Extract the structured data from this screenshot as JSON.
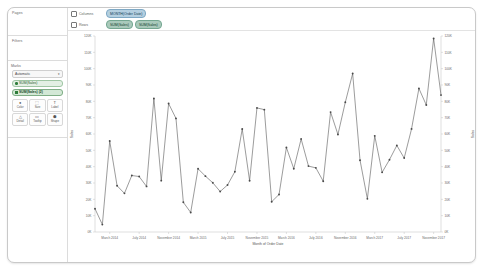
{
  "app": {
    "sidebar": {
      "pages_label": "Pages",
      "filters_label": "Filters",
      "marks_label": "Marks",
      "mark_type": "Automatic",
      "mark_type_caret": "▾",
      "shelf_pills": [
        {
          "text": "SUM(Sales)",
          "icon": "measure-dot"
        },
        {
          "text": "SUM(Sales) (2)",
          "icon": "measure-square"
        }
      ],
      "mark_buttons": [
        {
          "label": "Color",
          "icon": "color-icon",
          "glyph": "●"
        },
        {
          "label": "Size",
          "icon": "size-icon",
          "glyph": "⬚"
        },
        {
          "label": "Label",
          "icon": "label-icon",
          "glyph": "T"
        },
        {
          "label": "Detail",
          "icon": "detail-icon",
          "glyph": "△"
        },
        {
          "label": "Tooltip",
          "icon": "tooltip-icon",
          "glyph": "▭"
        },
        {
          "label": "Shape",
          "icon": "shape-icon",
          "glyph": "⬢"
        }
      ]
    },
    "shelves": {
      "columns_label": "Columns",
      "rows_label": "Rows",
      "columns_pills": [
        {
          "text": "MONTH(Order Date)",
          "color": "blue"
        }
      ],
      "rows_pills": [
        {
          "text": "SUM(Sales)",
          "color": "teal"
        },
        {
          "text": "SUM(Sales)",
          "color": "teal"
        }
      ]
    }
  },
  "chart_data": {
    "type": "line",
    "title": "",
    "xlabel": "Month of Order Date",
    "ylabel": "Sales",
    "ylabel_right": "Sales",
    "ylim": [
      0,
      120000
    ],
    "ytick_values": [
      0,
      10000,
      20000,
      30000,
      40000,
      50000,
      60000,
      70000,
      80000,
      90000,
      100000,
      110000,
      120000
    ],
    "ytick_labels": [
      "0K",
      "10K",
      "20K",
      "30K",
      "40K",
      "50K",
      "60K",
      "70K",
      "80K",
      "90K",
      "100K",
      "110K",
      "120K"
    ],
    "ytick_labels_right": [
      "0K",
      "10K",
      "20K",
      "30K",
      "40K",
      "50K",
      "60K",
      "70K",
      "80K",
      "90K",
      "100K",
      "110K",
      "120K"
    ],
    "grid": false,
    "legend_position": "none",
    "marker": "circle",
    "line_color": "#4a4a4a",
    "x": [
      "January 2014",
      "February 2014",
      "March 2014",
      "April 2014",
      "May 2014",
      "June 2014",
      "July 2014",
      "August 2014",
      "September 2014",
      "October 2014",
      "November 2014",
      "December 2014",
      "January 2015",
      "February 2015",
      "March 2015",
      "April 2015",
      "May 2015",
      "June 2015",
      "July 2015",
      "August 2015",
      "September 2015",
      "October 2015",
      "November 2015",
      "December 2015",
      "January 2016",
      "February 2016",
      "March 2016",
      "April 2016",
      "May 2016",
      "June 2016",
      "July 2016",
      "August 2016",
      "September 2016",
      "October 2016",
      "November 2016",
      "December 2016",
      "January 2017",
      "February 2017",
      "March 2017",
      "April 2017",
      "May 2017",
      "June 2017",
      "July 2017",
      "August 2017",
      "September 2017",
      "October 2017",
      "November 2017",
      "December 2017"
    ],
    "xtick_labels": [
      "March 2014",
      "July 2014",
      "November 2014",
      "March 2015",
      "July 2015",
      "November 2015",
      "March 2016",
      "July 2016",
      "November 2016",
      "March 2017",
      "July 2017",
      "November 2017"
    ],
    "xtick_indices": [
      2,
      6,
      10,
      14,
      18,
      22,
      26,
      30,
      34,
      38,
      42,
      46
    ],
    "series": [
      {
        "name": "SUM(Sales)",
        "values": [
          14236,
          4520,
          55691,
          28295,
          23648,
          34595,
          33946,
          27909,
          81777,
          31453,
          78629,
          69545,
          18174,
          11951,
          38726,
          34196,
          30132,
          24798,
          28765,
          36898,
          63101,
          31405,
          75972,
          74919,
          18542,
          22979,
          51715,
          38750,
          56988,
          40344,
          39262,
          31116,
          73410,
          59688,
          79412,
          96999,
          43971,
          20301,
          58872,
          36522,
          44261,
          52982,
          45264,
          63121,
          87866,
          77777,
          118448,
          83829
        ]
      }
    ]
  }
}
